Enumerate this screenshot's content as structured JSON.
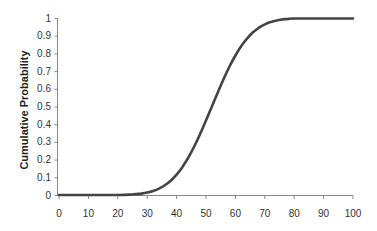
{
  "chart_data": {
    "type": "line",
    "title": "",
    "xlabel": "",
    "ylabel": "Cumulative Probability",
    "xlim": [
      0,
      100
    ],
    "ylim": [
      0,
      1
    ],
    "grid": false,
    "legend": null,
    "x_ticks": [
      0,
      10,
      20,
      30,
      40,
      50,
      60,
      70,
      80,
      90,
      100
    ],
    "y_ticks": [
      0,
      0.1,
      0.2,
      0.3,
      0.4,
      0.5,
      0.6,
      0.7,
      0.8,
      0.9,
      1
    ],
    "y_tick_labels": [
      "0",
      "0.1",
      "0.2",
      "0.3",
      "0.4",
      "0.5",
      "0.6",
      "0.7",
      "0.8",
      "0.9",
      "1"
    ],
    "series": [
      {
        "name": "Cumulative Probability",
        "color": "#444444",
        "x": [
          0,
          10,
          20,
          24,
          26,
          28,
          30,
          32,
          34,
          36,
          38,
          40,
          42,
          44,
          46,
          48,
          50,
          52,
          54,
          56,
          58,
          60,
          62,
          64,
          66,
          68,
          70,
          72,
          74,
          76,
          78,
          80,
          90,
          100
        ],
        "values": [
          0,
          0,
          0,
          0.002,
          0.005,
          0.008,
          0.014,
          0.023,
          0.036,
          0.055,
          0.081,
          0.115,
          0.159,
          0.212,
          0.274,
          0.345,
          0.421,
          0.5,
          0.579,
          0.655,
          0.726,
          0.788,
          0.841,
          0.885,
          0.919,
          0.945,
          0.964,
          0.977,
          0.986,
          0.992,
          0.995,
          0.997,
          0.997,
          0.997
        ]
      }
    ]
  }
}
